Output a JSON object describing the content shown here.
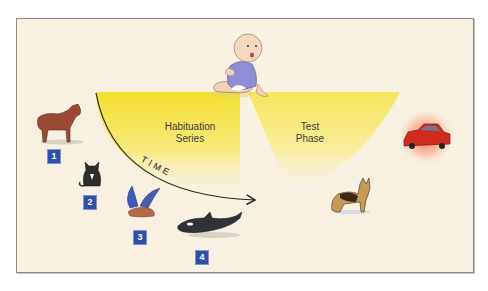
{
  "diagram": {
    "sectors": {
      "habituation": {
        "label_line1": "Habituation",
        "label_line2": "Series"
      },
      "test": {
        "label_line1": "Test",
        "label_line2": "Phase"
      }
    },
    "time_axis": {
      "label": "TIME"
    },
    "habituation_stimuli": [
      {
        "number": "1",
        "animal": "horse"
      },
      {
        "number": "2",
        "animal": "cat"
      },
      {
        "number": "3",
        "animal": "bird"
      },
      {
        "number": "4",
        "animal": "orca"
      }
    ],
    "test_stimuli": [
      {
        "animal": "dog"
      },
      {
        "object": "red car (highlighted)"
      }
    ],
    "colors": {
      "background": "#f8f1e2",
      "beam_yellow": "#f5e13a",
      "badge_blue": "#2f4fa8",
      "car_red": "#d12a1f",
      "car_glow": "#f56a4a"
    }
  }
}
